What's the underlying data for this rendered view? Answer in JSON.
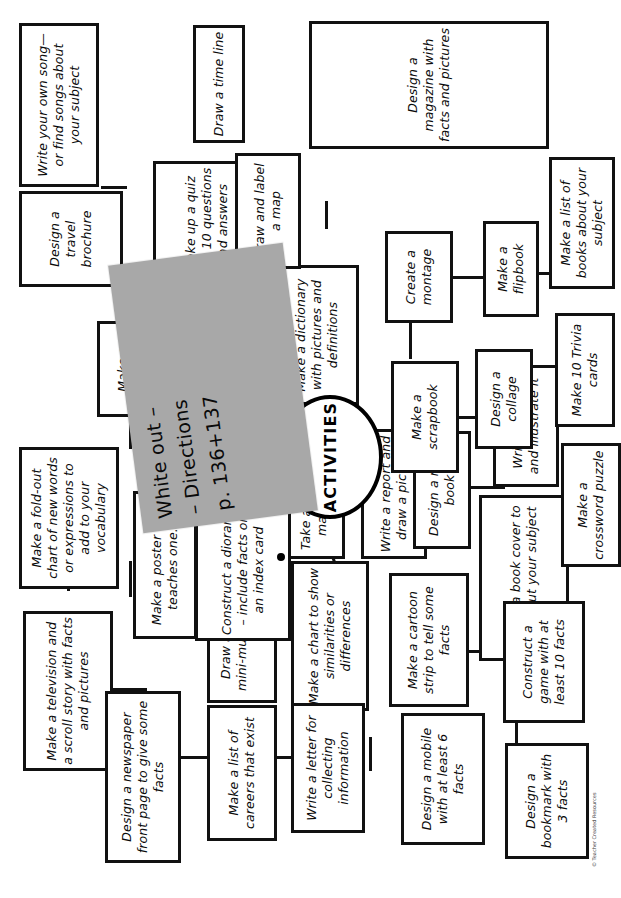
{
  "document": {
    "type": "mind-map worksheet",
    "hub_label": "ACTIVITIES",
    "footnote": "© Teacher Created Resources"
  },
  "sticky_note": {
    "color": "#a8a8a8",
    "text": "White out –\n– Directions\n     p. 136+137"
  },
  "nodes": {
    "television_scroll": "Make a television and a scroll story with facts and pictures",
    "foldout_chart": "Make a fold-out chart of new words or expressions to add to your vocabulary",
    "wordfind": "Make a wordfind",
    "travel_brochure": "Design a travel brochure",
    "own_song": "Write your own song—or find songs about your subject",
    "newspaper_front": "Design a newspaper front page to give some facts",
    "poster_teaches": "Make a poster that teaches one...",
    "model_clay": "Make a model of ... clay, wood, or soap",
    "quiz_10": "Make up a quiz with 10 questions and answers",
    "mini_mural": "Draw and color a mini-mural Label the facts",
    "survey_graph": "Take a survey and make a graph",
    "diorama": "Construct a diorama – include facts on an index card",
    "careers_list": "Make a list of careers that exist",
    "chart_similarities": "Make a chart to show similarities or differences",
    "report_picture": "Write a report and draw a picture",
    "dictionary": "Make a dictionary with pictures and definitions",
    "label_map": "Draw and label a map",
    "time_line": "Draw a time line",
    "letter_collecting": "Write a letter for collecting information",
    "magazine": "Design a magazine with facts and pictures",
    "mini_book": "Design a mini-book",
    "scrapbook": "Make a scrapbook",
    "montage": "Create a montage",
    "mobile_6": "Design a mobile with at least 6 facts",
    "cartoon_strip": "Make a cartoon strip to tell some facts",
    "book_cover": "Create a book cover to tell about your subject",
    "poem": "Write a poem and illustrate it",
    "collage": "Design a collage",
    "flipbook": "Make a flipbook",
    "bookmark_3": "Design a bookmark with 3 facts",
    "game_10": "Construct a game with at least 10 facts",
    "crossword": "Make a crossword puzzle",
    "trivia_cards": "Make 10 Trivia cards",
    "books_list": "Make a list of books about your subject"
  }
}
